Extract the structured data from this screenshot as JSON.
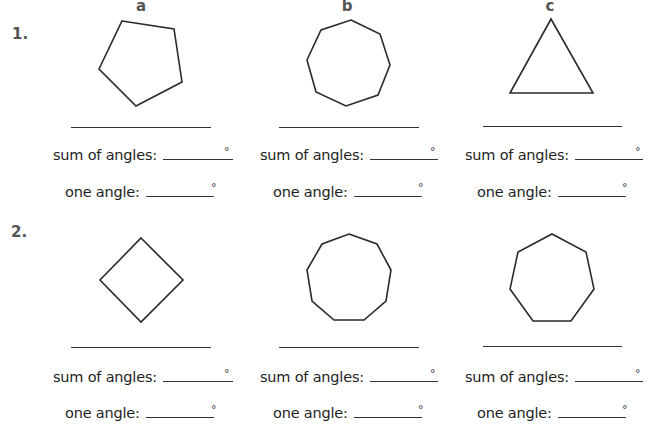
{
  "columns": [
    "a",
    "b",
    "c"
  ],
  "problems": [
    {
      "number": "1.",
      "items": [
        {
          "column": "a",
          "shape": "pentagon",
          "sides": 5,
          "points": "122,21 174,29 182,82 136,106 99,69",
          "line_x": 70,
          "label_x": 52
        },
        {
          "column": "b",
          "shape": "octagon",
          "sides": 8,
          "points": "351,20 380,34 390,65 378,95 346,106 316,92 307,60 321,30",
          "line_x": 279,
          "label_x": 260
        },
        {
          "column": "c",
          "shape": "triangle",
          "sides": 3,
          "points": "551,19 510,93 593,93",
          "line_x": 483,
          "label_x": 465
        }
      ]
    },
    {
      "number": "2.",
      "items": [
        {
          "column": "a",
          "shape": "square",
          "sides": 4,
          "points": "141,238 183,280 141,322 100,280"
        },
        {
          "column": "b",
          "shape": "nonagon",
          "sides": 9,
          "points": "349,234 377,244 391,270 386,301 364,320 334,320 312,301 307,270 322,244"
        },
        {
          "column": "c",
          "shape": "heptagon",
          "sides": 7,
          "points": "552,234 586,252 594,289 571,321 533,321 510,289 518,252"
        }
      ]
    }
  ],
  "labels": {
    "sum_of_angles": "sum of angles:",
    "one_angle": "one angle:",
    "degree_symbol": "°"
  },
  "answers": {
    "p1a_name": "",
    "p1a_sum": "",
    "p1a_one": "",
    "p1b_name": "",
    "p1b_sum": "",
    "p1b_one": "",
    "p1c_name": "",
    "p1c_sum": "",
    "p1c_one": "",
    "p2a_name": "",
    "p2a_sum": "",
    "p2a_one": "",
    "p2b_name": "",
    "p2b_sum": "",
    "p2b_one": "",
    "p2c_name": "",
    "p2c_sum": "",
    "p2c_one": ""
  },
  "colors": {
    "ink": "#1e1e1e",
    "heading_gray": "#555555",
    "background": "#ffffff"
  }
}
